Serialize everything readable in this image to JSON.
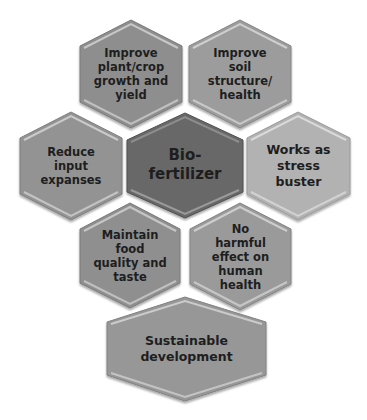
{
  "diagram": {
    "center": {
      "lines": [
        "Bio-",
        "fertilizer"
      ],
      "fill": "#686868"
    },
    "nodes": [
      {
        "id": "top-left",
        "lines": [
          "Improve",
          "plant/crop",
          "growth and",
          "yield"
        ],
        "fill": "#8e8e8e"
      },
      {
        "id": "top-right",
        "lines": [
          "Improve",
          "soil",
          "structure/",
          "health"
        ],
        "fill": "#9c9c9c"
      },
      {
        "id": "left",
        "lines": [
          "Reduce",
          "input",
          "expanses"
        ],
        "fill": "#939393"
      },
      {
        "id": "right",
        "lines": [
          "Works as",
          "stress",
          "buster"
        ],
        "fill": "#b2b2b2"
      },
      {
        "id": "bottom-left",
        "lines": [
          "Maintain",
          "food",
          "quality and",
          "taste"
        ],
        "fill": "#8f8f8f"
      },
      {
        "id": "bottom-right",
        "lines": [
          "No",
          "harmful",
          "effect on",
          "human",
          "health"
        ],
        "fill": "#9a9a9a"
      },
      {
        "id": "bottom",
        "lines": [
          "Sustainable",
          "development"
        ],
        "fill": "#979797"
      }
    ],
    "edge_highlight": "#d4d4d4",
    "edge_shadow": "#6f6f6f"
  }
}
